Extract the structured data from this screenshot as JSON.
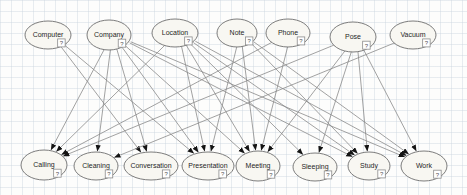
{
  "diagram": {
    "style": {
      "node_fill": "#f8f7f2",
      "node_stroke": "#6e6e6e",
      "label_color": "#1f1f1f",
      "edge_color": "#8a8a8a",
      "arrow_color": "#141414",
      "icon_fill": "#ffffff",
      "icon_stroke": "#8c8c8c",
      "icon_glyph_color": "#555555",
      "grid_color": "#cdd7e1",
      "background": "#fdfdfc"
    },
    "icon": {
      "glyph": "?",
      "name": "question-badge-icon"
    },
    "nodes": [
      {
        "id": "Computer",
        "label": "Computer",
        "x": 48,
        "y": 35,
        "rx": 23,
        "ry": 14,
        "row": "top"
      },
      {
        "id": "Company",
        "label": "Company",
        "x": 109,
        "y": 35,
        "rx": 22,
        "ry": 15,
        "row": "top"
      },
      {
        "id": "Location",
        "label": "Location",
        "x": 175,
        "y": 33,
        "rx": 23,
        "ry": 14,
        "row": "top"
      },
      {
        "id": "Note",
        "label": "Note",
        "x": 237,
        "y": 33,
        "rx": 20,
        "ry": 14,
        "row": "top"
      },
      {
        "id": "Phone",
        "label": "Phone",
        "x": 288,
        "y": 33,
        "rx": 22,
        "ry": 14,
        "row": "top"
      },
      {
        "id": "Pose",
        "label": "Pose",
        "x": 353,
        "y": 37,
        "rx": 23,
        "ry": 15,
        "row": "top"
      },
      {
        "id": "Vacuum",
        "label": "Vacuum",
        "x": 413,
        "y": 35,
        "rx": 23,
        "ry": 14,
        "row": "top"
      },
      {
        "id": "Calling",
        "label": "Calling",
        "x": 44,
        "y": 165,
        "rx": 23,
        "ry": 15,
        "row": "bottom"
      },
      {
        "id": "Cleaning",
        "label": "Cleaning",
        "x": 96,
        "y": 166,
        "rx": 22,
        "ry": 14,
        "row": "bottom"
      },
      {
        "id": "Conversation",
        "label": "Conversation",
        "x": 151,
        "y": 166,
        "rx": 27,
        "ry": 14,
        "row": "bottom"
      },
      {
        "id": "Presentation",
        "label": "Presentation",
        "x": 208,
        "y": 166,
        "rx": 26,
        "ry": 14,
        "row": "bottom"
      },
      {
        "id": "Meeting",
        "label": "Meeting",
        "x": 258,
        "y": 166,
        "rx": 22,
        "ry": 15,
        "row": "bottom"
      },
      {
        "id": "Sleeping",
        "label": "Sleeping",
        "x": 315,
        "y": 167,
        "rx": 22,
        "ry": 14,
        "row": "bottom"
      },
      {
        "id": "Study",
        "label": "Study",
        "x": 369,
        "y": 166,
        "rx": 21,
        "ry": 14,
        "row": "bottom"
      },
      {
        "id": "Work",
        "label": "Work",
        "x": 424,
        "y": 166,
        "rx": 23,
        "ry": 15,
        "row": "bottom"
      }
    ],
    "edges": [
      {
        "from": "Computer",
        "to": "Conversation"
      },
      {
        "from": "Computer",
        "to": "Presentation"
      },
      {
        "from": "Company",
        "to": "Calling"
      },
      {
        "from": "Company",
        "to": "Cleaning"
      },
      {
        "from": "Company",
        "to": "Conversation"
      },
      {
        "from": "Company",
        "to": "Presentation"
      },
      {
        "from": "Company",
        "to": "Meeting"
      },
      {
        "from": "Company",
        "to": "Study"
      },
      {
        "from": "Company",
        "to": "Work"
      },
      {
        "from": "Location",
        "to": "Calling"
      },
      {
        "from": "Location",
        "to": "Presentation"
      },
      {
        "from": "Location",
        "to": "Meeting"
      },
      {
        "from": "Location",
        "to": "Sleeping"
      },
      {
        "from": "Location",
        "to": "Study"
      },
      {
        "from": "Location",
        "to": "Work"
      },
      {
        "from": "Note",
        "to": "Presentation"
      },
      {
        "from": "Note",
        "to": "Meeting"
      },
      {
        "from": "Note",
        "to": "Study"
      },
      {
        "from": "Note",
        "to": "Work"
      },
      {
        "from": "Phone",
        "to": "Calling"
      },
      {
        "from": "Phone",
        "to": "Meeting"
      },
      {
        "from": "Pose",
        "to": "Calling"
      },
      {
        "from": "Pose",
        "to": "Meeting"
      },
      {
        "from": "Pose",
        "to": "Sleeping"
      },
      {
        "from": "Pose",
        "to": "Study"
      },
      {
        "from": "Pose",
        "to": "Work"
      },
      {
        "from": "Vacuum",
        "to": "Cleaning"
      }
    ]
  }
}
